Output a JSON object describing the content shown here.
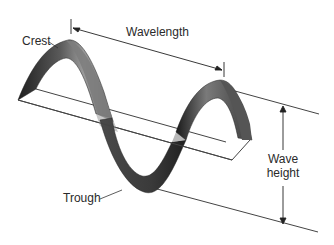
{
  "diagram": {
    "type": "wave-anatomy",
    "labels": {
      "crest": "Crest",
      "wavelength": "Wavelength",
      "trough": "Trough",
      "wave_height_line1": "Wave",
      "wave_height_line2": "height"
    },
    "colors": {
      "background": "#ffffff",
      "line": "#333333",
      "wave_dark": "#2b2b2b",
      "wave_mid": "#6a6a6a",
      "wave_light": "#bdbdbd",
      "text": "#2a2a2a"
    }
  }
}
